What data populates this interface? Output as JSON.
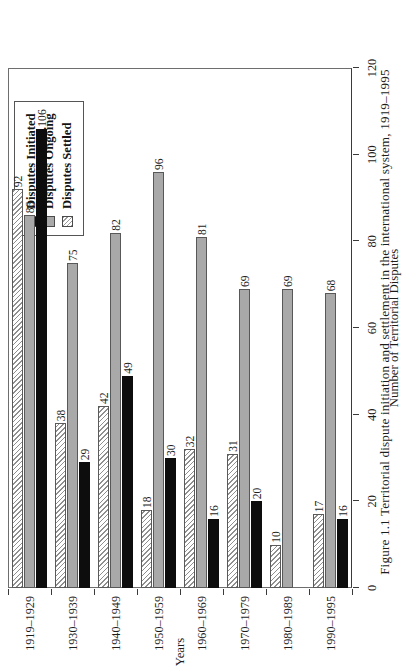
{
  "caption": "Figure 1.1  Territorial dispute initiation and settlement in the international system, 1919–1995",
  "legend": {
    "position": "top-left-outside",
    "items": [
      {
        "label": "Disputes Initiated",
        "key": "initiated",
        "swatch": "solid-black",
        "color": "#0d0d0d"
      },
      {
        "label": "Disputes Ongoing",
        "key": "ongoing",
        "swatch": "solid-gray",
        "color": "#a9a9a9"
      },
      {
        "label": "Disputes Settled",
        "key": "settled",
        "swatch": "diagonal-hatch",
        "color": "#8f8f8f"
      }
    ]
  },
  "chart_data": {
    "type": "bar",
    "orientation": "horizontal",
    "title": "",
    "xlabel": "Years",
    "ylabel": "Number of Territorial Disputes",
    "ylim": [
      0,
      120
    ],
    "yticks": [
      0,
      20,
      40,
      60,
      80,
      100,
      120
    ],
    "grid": false,
    "categories": [
      "1919–1929",
      "1930–1939",
      "1940–1949",
      "1950–1959",
      "1960–1969",
      "1970–1979",
      "1980–1989",
      "1990–1995"
    ],
    "series": [
      {
        "name": "Disputes Initiated",
        "key": "initiated",
        "values": [
          106,
          29,
          49,
          30,
          16,
          20,
          0,
          16
        ]
      },
      {
        "name": "Disputes Ongoing",
        "key": "ongoing",
        "values": [
          86,
          75,
          82,
          96,
          81,
          69,
          69,
          68
        ]
      },
      {
        "name": "Disputes Settled",
        "key": "settled",
        "values": [
          92,
          38,
          42,
          18,
          32,
          31,
          10,
          17
        ]
      }
    ],
    "data_labels": {
      "1919–1929": {
        "initiated": "106",
        "ongoing": "86",
        "settled": "92"
      },
      "1930–1939": {
        "initiated": "29",
        "ongoing": "75",
        "settled": "38"
      },
      "1940–1949": {
        "initiated": "49",
        "ongoing": "82",
        "settled": "42"
      },
      "1950–1959": {
        "initiated": "30",
        "ongoing": "96",
        "settled": "18"
      },
      "1960–1969": {
        "initiated": "16",
        "ongoing": "81",
        "settled": "32"
      },
      "1970–1979": {
        "initiated": "20",
        "ongoing": "69",
        "settled": "31"
      },
      "1980–1989": {
        "initiated": "",
        "ongoing": "69",
        "settled": "10"
      },
      "1990–1995": {
        "initiated": "16",
        "ongoing": "68",
        "settled": "17"
      }
    },
    "extra_labels": [
      {
        "category": "1980–1989",
        "series": "settled-lower",
        "text": "10",
        "value": 10
      }
    ]
  }
}
